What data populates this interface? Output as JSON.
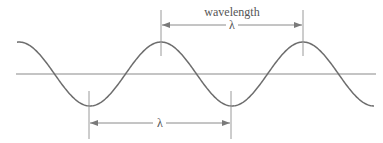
{
  "diagram": {
    "type": "sine-wave-wavelength",
    "top_label": "wavelength",
    "top_symbol": "λ",
    "bottom_symbol": "λ",
    "colors": {
      "wave": "#6e6e6e",
      "axis": "#8a8a8a",
      "markers": "#9a9a9a",
      "text": "#555555"
    },
    "wave": {
      "x_start": 17,
      "x_end": 374,
      "axis_y": 74,
      "amplitude": 32,
      "wavelength_px": 142,
      "peak_x": [
        161,
        303
      ],
      "trough_x": [
        89,
        231
      ]
    },
    "top_measure": {
      "x1": 161,
      "x2": 303,
      "y": 25,
      "tick_top": 10,
      "tick_bottom": 56
    },
    "bottom_measure": {
      "x1": 89,
      "x2": 231,
      "y": 123,
      "tick_top": 91,
      "tick_bottom": 139
    }
  }
}
